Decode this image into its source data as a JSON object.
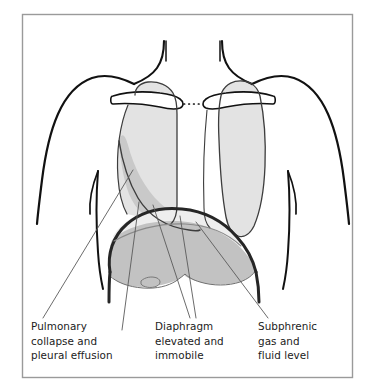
{
  "figure": {
    "type": "medical-anatomical-diagram",
    "frame_color": "#9a9a9a",
    "background_color": "#ffffff",
    "outline_color": "#111111"
  },
  "colors": {
    "lung_fill": "#e3e3e3",
    "effusion_fill": "#c9c9c9",
    "liver_fill": "#c2c2c2",
    "gas_band_fill": "#eeeeee",
    "clavicle_fill": "#ffffff",
    "leader_line": "#5a5a5a",
    "text": "#1b1b1b"
  },
  "labels": [
    {
      "name": "pulmonary-collapse",
      "lines": [
        "Pulmonary",
        "collapse and",
        "pleural effusion"
      ],
      "x": 31,
      "y": 330
    },
    {
      "name": "diaphragm-elevated",
      "lines": [
        "Diaphragm",
        "elevated and",
        "immobile"
      ],
      "x": 155,
      "y": 330
    },
    {
      "name": "subphrenic-gas",
      "lines": [
        "Subphrenic",
        "gas and",
        "fluid level"
      ],
      "x": 258,
      "y": 330
    }
  ],
  "anatomy": {
    "parts": [
      {
        "name": "neck-outline",
        "label": "Neck"
      },
      {
        "name": "left-shoulder-arm-outline",
        "label": "Left shoulder and arm"
      },
      {
        "name": "right-shoulder-arm-outline",
        "label": "Right shoulder and arm"
      },
      {
        "name": "left-clavicle",
        "label": "Left clavicle"
      },
      {
        "name": "right-clavicle",
        "label": "Right clavicle"
      },
      {
        "name": "sternal-notch-dotted-gap",
        "label": "Sternal notch gap"
      },
      {
        "name": "left-lung-collapsed",
        "label": "Collapsed left lung"
      },
      {
        "name": "pleural-effusion",
        "label": "Pleural effusion"
      },
      {
        "name": "right-lung",
        "label": "Right lung"
      },
      {
        "name": "diaphragm",
        "label": "Elevated diaphragm"
      },
      {
        "name": "gas-fluid-level",
        "label": "Subphrenic gas and fluid level"
      },
      {
        "name": "liver",
        "label": "Liver"
      },
      {
        "name": "gallbladder",
        "label": "Gallbladder"
      },
      {
        "name": "left-costal-margin",
        "label": "Left costal margin"
      },
      {
        "name": "right-costal-margin",
        "label": "Right costal margin"
      }
    ]
  }
}
